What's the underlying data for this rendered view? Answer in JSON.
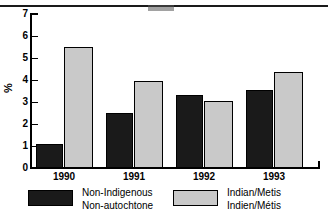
{
  "chart_data": {
    "type": "bar",
    "title": "",
    "subtitle": "",
    "xlabel": "",
    "ylabel": "%",
    "categories": [
      "1990",
      "1991",
      "1992",
      "1993"
    ],
    "series": [
      {
        "name": "Non-Indigenous / Non-autochtone",
        "color": "#1a1a1a",
        "values": [
          1.1,
          2.5,
          3.3,
          3.55
        ]
      },
      {
        "name": "Indian/Metis / Indien/Métis",
        "color": "#c9c9c9",
        "values": [
          5.5,
          3.95,
          3.05,
          4.35
        ]
      }
    ],
    "ylim": [
      0,
      7
    ],
    "ytick_labels": [
      "0",
      "1",
      "2",
      "3",
      "4",
      "5",
      "6",
      "7"
    ],
    "ytick_values": [
      0,
      1,
      2,
      3,
      4,
      5,
      6,
      7
    ],
    "grid": false,
    "legend_position": "bottom"
  },
  "axis": {
    "y_label": "%",
    "y_ticks": [
      "7",
      "6",
      "5",
      "4",
      "3",
      "2",
      "1",
      "0"
    ],
    "x_ticks": [
      "1990",
      "1991",
      "1992",
      "1993"
    ]
  },
  "legend": {
    "entries": [
      {
        "swatch": "dark",
        "line1": "Non-Indigenous",
        "line2": "Non-autochtone"
      },
      {
        "swatch": "light",
        "line1": "Indian/Metis",
        "line2": "Indien/Métis"
      }
    ]
  },
  "colors": {
    "series_dark": "#1a1a1a",
    "series_light": "#c9c9c9",
    "axis": "#000000",
    "background": "#ffffff"
  }
}
